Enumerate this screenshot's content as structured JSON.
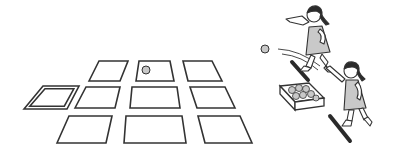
{
  "scene": {
    "description": "Two girls playing a ball-tossing game onto a grid of floor tiles",
    "width": 393,
    "height": 160,
    "colors": {
      "background": "#ffffff",
      "line": "#333333",
      "ball_fill": "#c8c8c8",
      "dress_fill": "#c9c9c9",
      "hair_fill": "#2b2b2b",
      "bar_fill": "#2a2a2a"
    },
    "tiles": [
      {
        "name": "tile-row1-left",
        "points": "89,81 99,61 128,61 120,81",
        "double": false
      },
      {
        "name": "tile-row1-center",
        "points": "136,81 139,61 170,61 174,81",
        "double": false
      },
      {
        "name": "tile-row1-right",
        "points": "188,81 183,61 212,61 222,81",
        "double": false
      },
      {
        "name": "tile-row2-start",
        "points": "24,109 43,86 79,86 67,109",
        "double": true
      },
      {
        "name": "tile-row2-left",
        "points": "75,108 86,87 120,87 115,108",
        "double": false
      },
      {
        "name": "tile-row2-center",
        "points": "130,108 132,87 177,87 180,108",
        "double": false
      },
      {
        "name": "tile-row2-right",
        "points": "197,108 190,87 225,87 235,108",
        "double": false
      },
      {
        "name": "tile-row3-left",
        "points": "57,143 69,116 112,116 106,143",
        "double": false
      },
      {
        "name": "tile-row3-center",
        "points": "124,143 126,116 182,116 186,143",
        "double": false
      },
      {
        "name": "tile-row3-right",
        "points": "205,143 198,116 240,116 252,143",
        "double": false
      }
    ],
    "balls": [
      {
        "name": "ball-on-tile",
        "cx": 146,
        "cy": 70,
        "r": 4
      },
      {
        "name": "ball-in-flight",
        "cx": 265,
        "cy": 49,
        "r": 4
      }
    ],
    "figures": [
      {
        "name": "girl-throwing",
        "role": "thrower"
      },
      {
        "name": "girl-waiting",
        "role": "next player"
      }
    ],
    "props": [
      {
        "name": "ball-box",
        "contents": "balls"
      },
      {
        "name": "throw-line-front"
      },
      {
        "name": "throw-line-back"
      }
    ]
  }
}
